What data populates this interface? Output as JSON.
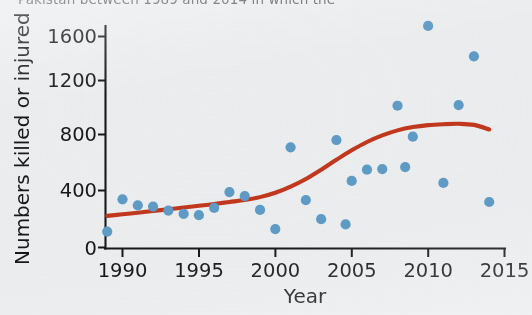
{
  "figure": {
    "clipped_caption": "Pakistan between 1989 and 2014 in which the",
    "background_color": "#eceef0",
    "point_color": "#5f9cc6",
    "trend_color": "#c2381d"
  },
  "chart_data": {
    "type": "scatter",
    "title": "",
    "xlabel": "Year",
    "ylabel": "Numbers killed or injured",
    "xlim": [
      1988.9,
      2015.0
    ],
    "ylim": [
      0,
      1760
    ],
    "grid": false,
    "legend": null,
    "xticks": [
      1990,
      1995,
      2000,
      2005,
      2010,
      2015
    ],
    "xticklabels": [
      "1990",
      "1995",
      "2000",
      "2005",
      "2010",
      "2015"
    ],
    "yticks": [
      0,
      400,
      800,
      1200,
      1600
    ],
    "yticklabels": [
      "0",
      "400",
      "800",
      "1200",
      "1600"
    ],
    "series": [
      {
        "name": "Numbers killed or injured",
        "marker": "circle",
        "color": "#5f9cc6",
        "x": [
          1989,
          1990,
          1991,
          1992,
          1993,
          1994,
          1995,
          1996,
          1997,
          1998,
          1999,
          2000,
          2001,
          2002,
          2003,
          2004,
          2004.6,
          2005,
          2006,
          2007,
          2008,
          2008.5,
          2009,
          2010,
          2011,
          2012,
          2013,
          2014
        ],
        "y": [
          120,
          365,
          320,
          310,
          280,
          255,
          245,
          300,
          420,
          390,
          285,
          140,
          760,
          360,
          215,
          815,
          175,
          505,
          590,
          595,
          1075,
          610,
          840,
          1680,
          490,
          1080,
          1450,
          345
        ]
      }
    ],
    "trend_line": {
      "name": "smoothed trend",
      "color": "#c2381d",
      "x": [
        1989.0,
        1990.0,
        1991.0,
        1992.0,
        1993.0,
        1994.0,
        1995.0,
        1996.0,
        1997.0,
        1998.0,
        1999.0,
        2000.0,
        2001.0,
        2002.0,
        2003.0,
        2004.0,
        2005.0,
        2006.0,
        2007.0,
        2008.0,
        2009.0,
        2010.0,
        2011.0,
        2012.0,
        2013.0,
        2014.0
      ],
      "y": [
        240,
        252,
        264,
        277,
        290,
        303,
        316,
        330,
        345,
        360,
        382,
        415,
        462,
        520,
        590,
        665,
        737,
        800,
        850,
        888,
        913,
        928,
        935,
        938,
        930,
        895
      ]
    }
  }
}
